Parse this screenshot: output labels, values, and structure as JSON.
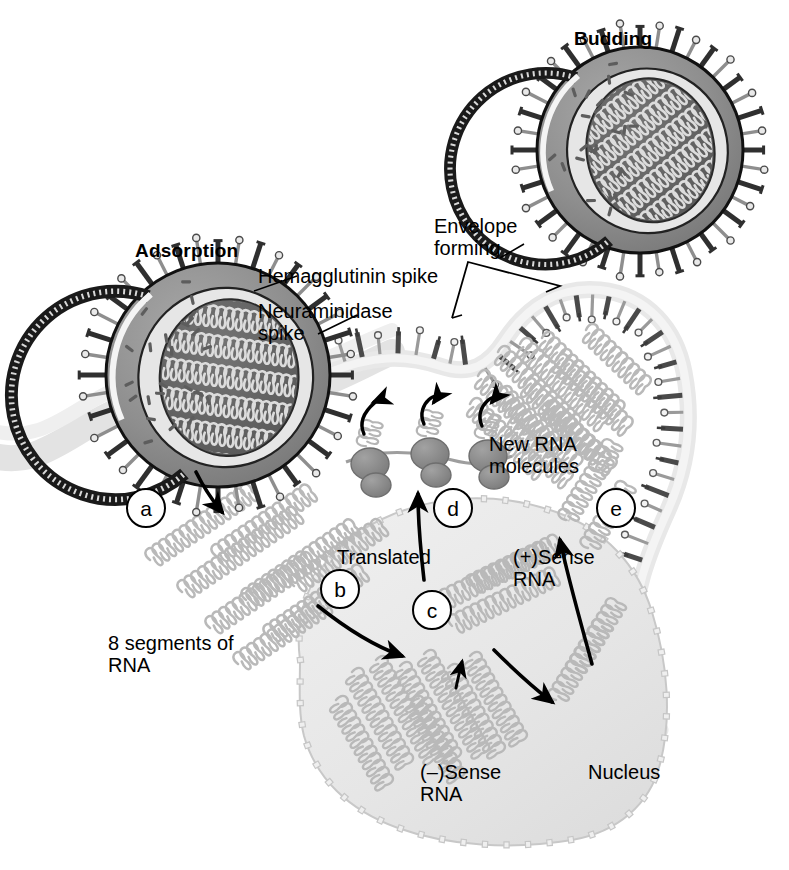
{
  "figure": {
    "title_semantic": "influenza-virus-replication-cycle",
    "background_color": "#ffffff"
  },
  "labels": {
    "budding": "Budding",
    "adsorption": "Adsorption",
    "hemagglutinin_spike": "Hemagglutinin spike",
    "neuraminidase_spike": "Neuraminidase\nspike",
    "envelope_forming": "Envelope\nforming",
    "eight_segments_rna": "8 segments of\nRNA",
    "new_rna_molecules": "New RNA\nmolecules",
    "translated": "Translated",
    "plus_sense_rna": "(+)Sense\nRNA",
    "minus_sense_rna": "(–)Sense\nRNA",
    "nucleus": "Nucleus"
  },
  "steps": [
    {
      "id": "a",
      "label": "a",
      "cx": 146,
      "cy": 508
    },
    {
      "id": "b",
      "label": "b",
      "cx": 340,
      "cy": 589
    },
    {
      "id": "c",
      "label": "c",
      "cx": 432,
      "cy": 610
    },
    {
      "id": "d",
      "label": "d",
      "cx": 453,
      "cy": 508
    },
    {
      "id": "e",
      "label": "e",
      "cx": 616,
      "cy": 508
    }
  ],
  "colors": {
    "ink": "#000000",
    "membrane_band": "#e2e2e2",
    "membrane_band_edge": "#d2d2d2",
    "nucleus_fill": "#e8e8e8",
    "nucleus_edge": "#cfcfcf",
    "rna_helix": "#b9b9b9",
    "rna_helix_dark": "#9a9a9a",
    "virion_envelope": "#8f8f8f",
    "virion_core": "#6a6a6a",
    "virion_core_inner": "#5a5a5a",
    "ribosome": "#8a8a8a",
    "spike_light": "#d8d8d8",
    "spike_dark": "#3a3a3a"
  },
  "virions": [
    {
      "name": "adsorbing-virion",
      "cx": 218,
      "cy": 375,
      "r": 112,
      "stage": "Adsorption"
    },
    {
      "name": "budded-virion",
      "cx": 640,
      "cy": 150,
      "r": 103,
      "stage": "Budding"
    }
  ],
  "counts": {
    "ribosomes": 3,
    "rna_segments": 8
  }
}
